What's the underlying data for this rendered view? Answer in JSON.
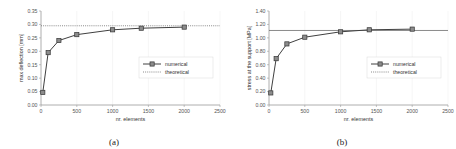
{
  "figure": {
    "panels": [
      {
        "caption": "(a)",
        "xlabel": "nr. elements",
        "ylabel": "max deflection [mm]",
        "legend": [
          "numerical",
          "theoretical"
        ]
      },
      {
        "caption": "(b)",
        "xlabel": "nr. elements",
        "ylabel": "stress at the support [MPa]",
        "legend": [
          "numerical",
          "theoretical"
        ]
      }
    ]
  },
  "chart_data": [
    {
      "type": "line",
      "title": "",
      "panel": "(a)",
      "xlabel": "nr. elements",
      "ylabel": "max deflection [mm]",
      "xlim": [
        0,
        2500
      ],
      "ylim": [
        0.0,
        0.35
      ],
      "xticks": [
        0,
        500,
        1000,
        1500,
        2000,
        2500
      ],
      "xticklabels": [
        "0",
        "500",
        "1000",
        "1500",
        "2000",
        "2500"
      ],
      "yticks": [
        0.0,
        0.05,
        0.1,
        0.15,
        0.2,
        0.25,
        0.3,
        0.35
      ],
      "yticklabels": [
        "0.00",
        "0.05",
        "0.10",
        "0.15",
        "0.20",
        "0.25",
        "0.30",
        "0.35"
      ],
      "grid": false,
      "legend_position": "center-right",
      "series": [
        {
          "name": "numerical",
          "style": "solid-line-square-marker",
          "color": "#404040",
          "x": [
            25,
            100,
            250,
            500,
            1000,
            1400,
            2000
          ],
          "y": [
            0.047,
            0.195,
            0.24,
            0.262,
            0.28,
            0.286,
            0.29
          ]
        },
        {
          "name": "theoretical",
          "style": "dotted-horizontal-line",
          "color": "#595959",
          "value": 0.295
        }
      ]
    },
    {
      "type": "line",
      "title": "",
      "panel": "(b)",
      "xlabel": "nr. elements",
      "ylabel": "stress at the support [MPa]",
      "xlim": [
        0,
        2500
      ],
      "ylim": [
        0.0,
        1.4
      ],
      "xticks": [
        0,
        500,
        1000,
        1500,
        2000,
        2500
      ],
      "xticklabels": [
        "0",
        "500",
        "1000",
        "1500",
        "2000",
        "2500"
      ],
      "yticks": [
        0.0,
        0.2,
        0.4,
        0.6,
        0.8,
        1.0,
        1.2,
        1.4
      ],
      "yticklabels": [
        "0.00",
        "0.20",
        "0.40",
        "0.60",
        "0.80",
        "1.00",
        "1.20",
        "1.40"
      ],
      "grid": false,
      "legend_position": "center-right",
      "series": [
        {
          "name": "numerical",
          "style": "solid-line-square-marker",
          "color": "#404040",
          "x": [
            25,
            100,
            250,
            500,
            1000,
            1400,
            2000
          ],
          "y": [
            0.18,
            0.69,
            0.91,
            1.01,
            1.09,
            1.12,
            1.13
          ]
        },
        {
          "name": "theoretical",
          "style": "solid-thin-horizontal-line",
          "color": "#595959",
          "value": 1.11
        }
      ]
    }
  ]
}
